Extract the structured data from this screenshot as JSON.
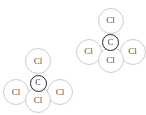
{
  "diagram": {
    "background": "#ffffff",
    "colors": {
      "cl_stroke": "#cecece",
      "cl_text": "#4d4d4d",
      "c_stroke": "#222222",
      "c_text": "#2b2b2b",
      "atom_fill": "#ffffff"
    },
    "clusters": [
      {
        "name": "molecule-bottom-left",
        "atoms": [
          {
            "element": "Cl",
            "role": "top-chlorine",
            "x": 38,
            "y": 61,
            "r": 13,
            "type": "cl"
          },
          {
            "element": "Cl",
            "role": "left-chlorine",
            "x": 16,
            "y": 92,
            "r": 13,
            "type": "cl"
          },
          {
            "element": "Cl",
            "role": "right-chlorine",
            "x": 60,
            "y": 92,
            "r": 13,
            "type": "cl"
          },
          {
            "element": "Cl",
            "role": "bottom-chlorine",
            "x": 38,
            "y": 100,
            "r": 13,
            "type": "cl"
          },
          {
            "element": "C",
            "role": "central-carbon",
            "x": 38,
            "y": 83,
            "r": 8.5,
            "type": "c"
          }
        ]
      },
      {
        "name": "molecule-top-right",
        "atoms": [
          {
            "element": "Cl",
            "role": "top-chlorine",
            "x": 110.5,
            "y": 20.5,
            "r": 13,
            "type": "cl"
          },
          {
            "element": "Cl",
            "role": "left-chlorine",
            "x": 88.5,
            "y": 51.5,
            "r": 13,
            "type": "cl"
          },
          {
            "element": "Cl",
            "role": "right-chlorine",
            "x": 132.5,
            "y": 51.5,
            "r": 13,
            "type": "cl"
          },
          {
            "element": "Cl",
            "role": "bottom-chlorine",
            "x": 110.5,
            "y": 60,
            "r": 13,
            "type": "cl"
          },
          {
            "element": "C",
            "role": "central-carbon",
            "x": 110.5,
            "y": 42.5,
            "r": 8.5,
            "type": "c"
          }
        ]
      }
    ]
  }
}
